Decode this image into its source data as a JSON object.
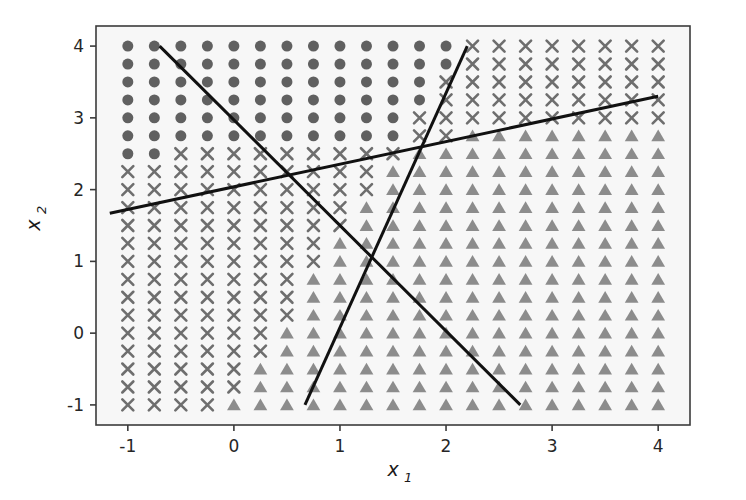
{
  "figure": {
    "background": "#ffffff",
    "plot_background": "#f7f7f7",
    "spine_color": "#3b3b3b",
    "boundary_color": "#111111"
  },
  "axes": {
    "x_label_main": "x",
    "x_label_sub": "1",
    "y_label_main": "x",
    "y_label_sub": "2",
    "x_ticks": [
      "-1",
      "0",
      "1",
      "2",
      "3",
      "4"
    ],
    "y_ticks": [
      "-1",
      "0",
      "1",
      "2",
      "3",
      "4"
    ]
  },
  "chart_data": {
    "type": "scatter",
    "title": "",
    "xlabel": "x1",
    "ylabel": "x2",
    "xlim": [
      -1.3,
      4.3
    ],
    "ylim": [
      -1.28,
      4.28
    ],
    "xticks": [
      -1,
      0,
      1,
      2,
      3,
      4
    ],
    "yticks": [
      -1,
      0,
      1,
      2,
      3,
      4
    ],
    "grid": false,
    "legend": "none",
    "grid_spec": {
      "x_start": -1.0,
      "x_end": 4.0,
      "x_count": 21,
      "y_start": -1.0,
      "y_end": 4.0,
      "y_count": 21
    },
    "classes": [
      {
        "name": "class-0",
        "marker": "circle",
        "color": "#606060",
        "size": 11
      },
      {
        "name": "class-1",
        "marker": "x",
        "color": "#6e6e6e",
        "size": 11
      },
      {
        "name": "class-2",
        "marker": "triangle",
        "color": "#8c8c8c",
        "size": 11
      }
    ],
    "region_rules": [
      {
        "class": "class-0",
        "rule": "x2 > 2.55 + 0.09*x1 AND x2 > 2.22*x1 - 0.88"
      },
      {
        "class": "class-2",
        "rule": "x2 < 2.22*x1 - 0.88 AND x2 < 2.55 + 0.09*x1"
      },
      {
        "class": "class-1",
        "rule": "otherwise"
      }
    ],
    "boundaries": [
      {
        "name": "boundary-shallow-ascending",
        "x1": -1.17,
        "y1": 1.67,
        "x2": 4.0,
        "y2": 3.3
      },
      {
        "name": "boundary-steep-ascending",
        "x1": 0.67,
        "y1": -1.0,
        "x2": 2.2,
        "y2": 4.0
      },
      {
        "name": "boundary-descending",
        "x1": -0.7,
        "y1": 4.0,
        "x2": 2.7,
        "y2": -1.0
      }
    ]
  }
}
